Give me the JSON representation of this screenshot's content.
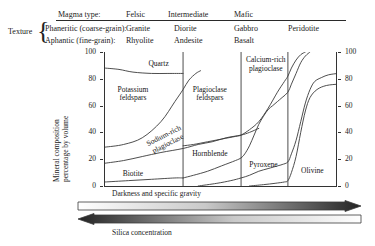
{
  "header": {
    "magma_type_label": "Magma type:",
    "texture_label": "Texture",
    "magma_types": [
      "Felsic",
      "Intermediate",
      "Mafic"
    ],
    "rows": [
      {
        "texture": "Phaneritic (coarse-grain):",
        "rocks": [
          "Granite",
          "Diorite",
          "Gabbro",
          "Peridotite"
        ]
      },
      {
        "texture": "Aphantic (fine-grain):",
        "rocks": [
          "Rhyolite",
          "Andesite",
          "Basalt"
        ]
      }
    ]
  },
  "chart_data": {
    "type": "area",
    "title": "",
    "xlabel": "",
    "ylabel": "Mineral composition percentage by volume",
    "ylim": [
      0,
      100
    ],
    "yticks": [
      0,
      20,
      40,
      60,
      80,
      100
    ],
    "ytick_labels_left": [
      "0",
      "20",
      "40",
      "60",
      "80",
      "100"
    ],
    "ytick_labels_right": [
      "0",
      "20",
      "40",
      "60",
      "80",
      "100"
    ],
    "grid": false,
    "legend": "none",
    "x_categories": [
      "Granite / Rhyolite",
      "Diorite / Andesite",
      "Gabbro / Basalt",
      "Peridotite"
    ],
    "column_dividers_pct": [
      33.5,
      58.4,
      78.5
    ],
    "regions": [
      {
        "name": "Quartz",
        "label": "Quartz",
        "label_x_pct": 23,
        "label_y_pct": 91,
        "rotation": 0
      },
      {
        "name": "Potassium feldspars",
        "label": "Potassium\nfeldspars",
        "label_x_pct": 12,
        "label_y_pct": 68,
        "rotation": 0
      },
      {
        "name": "Sodium-rich plagioclase",
        "label": "Sodium-rich\nplagioclase",
        "label_x_pct": 26,
        "label_y_pct": 34,
        "rotation": -27
      },
      {
        "name": "Biotite",
        "label": "Biotite",
        "label_x_pct": 12,
        "label_y_pct": 9,
        "rotation": 0
      },
      {
        "name": "Plagioclase feldspars",
        "label": "Plagioclase\nfeldspars",
        "label_x_pct": 45,
        "label_y_pct": 68,
        "rotation": 0
      },
      {
        "name": "Hornblende",
        "label": "Hornblende",
        "label_x_pct": 45,
        "label_y_pct": 24,
        "rotation": 0
      },
      {
        "name": "Calcium-rich plagioclase",
        "label": "Calcium-rich\nplagioclase",
        "label_x_pct": 69,
        "label_y_pct": 90,
        "rotation": 0
      },
      {
        "name": "Pyroxene",
        "label": "Pyroxene",
        "label_x_pct": 68,
        "label_y_pct": 16,
        "rotation": 0
      },
      {
        "name": "Olivine",
        "label": "Olivine",
        "label_x_pct": 89,
        "label_y_pct": 11,
        "rotation": 0
      }
    ],
    "series": [
      {
        "name": "quartz-lower-boundary",
        "comment": "top of potassium feldspar / bottom of quartz band",
        "points": [
          [
            0,
            88
          ],
          [
            6,
            87
          ],
          [
            12,
            85
          ],
          [
            20,
            84
          ],
          [
            27,
            84
          ],
          [
            33.5,
            84
          ]
        ]
      },
      {
        "name": "potassium-feldspar-lower-boundary",
        "points": [
          [
            0,
            29
          ],
          [
            8,
            31
          ],
          [
            16,
            36
          ],
          [
            24,
            48
          ],
          [
            30,
            63
          ],
          [
            33.5,
            72
          ],
          [
            36,
            79
          ],
          [
            39,
            84
          ],
          [
            41,
            86
          ]
        ]
      },
      {
        "name": "sodium-plagioclase-lower-boundary",
        "points": [
          [
            0,
            17
          ],
          [
            8,
            19
          ],
          [
            16,
            22
          ],
          [
            24,
            25
          ],
          [
            33.5,
            28
          ],
          [
            40,
            31
          ],
          [
            46,
            33
          ],
          [
            52,
            36
          ],
          [
            58.4,
            38
          ],
          [
            62,
            40
          ],
          [
            66,
            43
          ]
        ]
      },
      {
        "name": "biotite-lower-boundary",
        "points": [
          [
            0,
            3
          ],
          [
            10,
            4
          ],
          [
            20,
            5
          ],
          [
            30,
            6
          ],
          [
            33.5,
            6
          ]
        ]
      },
      {
        "name": "plagioclase-hornblende-boundary",
        "points": [
          [
            33.5,
            30
          ],
          [
            38,
            31
          ],
          [
            44,
            33
          ],
          [
            50,
            35
          ],
          [
            56,
            37
          ],
          [
            58.4,
            38
          ],
          [
            62,
            42
          ],
          [
            66,
            48
          ],
          [
            70,
            58
          ],
          [
            74,
            70
          ],
          [
            77,
            78
          ],
          [
            78.5,
            82
          ],
          [
            80,
            88
          ],
          [
            82,
            94
          ],
          [
            84,
            98
          ],
          [
            86,
            100
          ]
        ]
      },
      {
        "name": "hornblende-lower-boundary",
        "points": [
          [
            33.5,
            6
          ],
          [
            38,
            8
          ],
          [
            44,
            11
          ],
          [
            50,
            15
          ],
          [
            56,
            19
          ],
          [
            58.4,
            21
          ],
          [
            60,
            24
          ],
          [
            62,
            30
          ],
          [
            64,
            38
          ],
          [
            66,
            46
          ],
          [
            68,
            52
          ],
          [
            70,
            57
          ],
          [
            72,
            60
          ],
          [
            74,
            63
          ],
          [
            76,
            66
          ],
          [
            78.5,
            70
          ],
          [
            80,
            76
          ],
          [
            82,
            84
          ],
          [
            84,
            92
          ],
          [
            86,
            97
          ],
          [
            88,
            100
          ]
        ]
      },
      {
        "name": "pyroxene-lower-boundary",
        "points": [
          [
            40,
            0
          ],
          [
            48,
            2
          ],
          [
            54,
            4
          ],
          [
            58.4,
            6
          ],
          [
            62,
            8
          ],
          [
            66,
            11
          ],
          [
            70,
            13
          ],
          [
            74,
            15
          ],
          [
            76,
            16
          ],
          [
            78.5,
            18
          ],
          [
            80,
            24
          ],
          [
            82,
            34
          ],
          [
            84,
            48
          ],
          [
            86,
            62
          ],
          [
            88,
            72
          ],
          [
            90,
            78
          ],
          [
            93,
            81
          ],
          [
            96,
            83
          ],
          [
            100,
            84
          ]
        ]
      },
      {
        "name": "olivine-upper-left-boundary",
        "points": [
          [
            62,
            0
          ],
          [
            68,
            1
          ],
          [
            73,
            2
          ],
          [
            77,
            3
          ],
          [
            78.5,
            4
          ],
          [
            80,
            10
          ],
          [
            82,
            22
          ],
          [
            84,
            40
          ],
          [
            86,
            56
          ],
          [
            88,
            66
          ],
          [
            91,
            72
          ],
          [
            95,
            75
          ],
          [
            100,
            76
          ]
        ]
      }
    ]
  },
  "bottom_arrows": [
    {
      "name": "darkness-arrow",
      "label": "Darkness and specific gravity",
      "direction": "right",
      "gradient_from": "#ffffff",
      "gradient_to": "#2b2b2b"
    },
    {
      "name": "silica-arrow",
      "label": "Silica concentration",
      "direction": "left",
      "gradient_from": "#2b2b2b",
      "gradient_to": "#ffffff"
    }
  ],
  "colors": {
    "ink": "#1b1b1b",
    "line": "#333333",
    "background": "#ffffff"
  }
}
